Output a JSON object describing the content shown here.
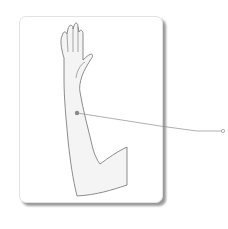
{
  "figure": {
    "marker": {
      "x": 77,
      "y": 113,
      "label": ""
    },
    "callout_end": {
      "x": 222,
      "y": 131
    }
  },
  "colors": {
    "card_bg": "#ffffff",
    "card_shadow": "#9a9a9a",
    "skin_fill": "#f4f4f4",
    "outline": "#707070",
    "marker": "#8a8a8a",
    "leader_line": "#8c8c8c"
  }
}
